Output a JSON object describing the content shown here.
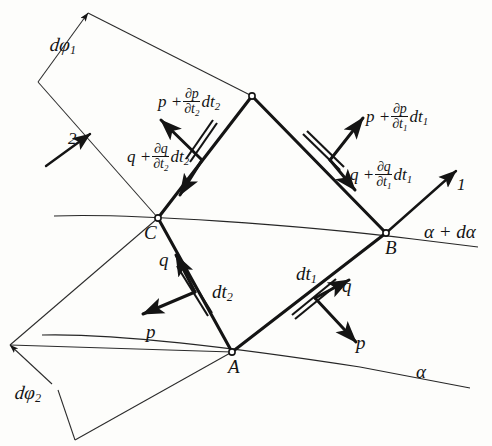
{
  "figure": {
    "background_color": "#fdfdfb",
    "ink_color": "#141414",
    "vertices": {
      "A": {
        "label": "A",
        "x": 232,
        "y": 352
      },
      "B": {
        "label": "B",
        "x": 386,
        "y": 233
      },
      "C": {
        "label": "C",
        "x": 158,
        "y": 218
      },
      "D": {
        "label": "",
        "x": 252,
        "y": 96
      }
    },
    "curve_labels": [
      {
        "name": "alpha-plus-dalpha",
        "text": "α + dα",
        "x": 424,
        "y": 222
      },
      {
        "name": "alpha",
        "text": "α",
        "x": 416,
        "y": 362
      }
    ],
    "axis_labels": [
      {
        "name": "direction-1",
        "text": "1",
        "x": 457,
        "y": 176
      },
      {
        "name": "direction-2",
        "text": "2",
        "x": 68,
        "y": 130
      }
    ],
    "angle_labels": [
      {
        "name": "d-phi-1",
        "text": "dφ",
        "sub": "1",
        "x": 50,
        "y": 35
      },
      {
        "name": "d-phi-2",
        "text": "dφ",
        "sub": "2",
        "x": 15,
        "y": 383
      }
    ],
    "force_labels": {
      "p_at_A_lower_left": {
        "text": "p",
        "x": 146,
        "y": 322
      },
      "q_at_A_lower_left": {
        "text": "q",
        "x": 159,
        "y": 274
      },
      "dt2_lower": {
        "text": "dt",
        "sub": "2",
        "x": 212,
        "y": 282
      },
      "p_at_A_lower_right": {
        "text": "p",
        "x": 356,
        "y": 333
      },
      "q_at_A_lower_right": {
        "text": "q",
        "x": 342,
        "y": 286
      },
      "dt1_lower": {
        "text": "dt",
        "sub": "1",
        "x": 300,
        "y": 268
      },
      "p_upper_left": {
        "lead": "p +",
        "num": "∂p",
        "den": "∂t",
        "den_sub": "2",
        "tail": "dt",
        "tail_sub": "2",
        "x": 158,
        "y": 90
      },
      "q_upper_left": {
        "lead": "q +",
        "num": "∂q",
        "den": "∂t",
        "den_sub": "2",
        "tail": "dt",
        "tail_sub": "2",
        "x": 131,
        "y": 145
      },
      "p_upper_right": {
        "lead": "p +",
        "num": "∂p",
        "den": "∂t",
        "den_sub": "1",
        "tail": "dt",
        "tail_sub": "1",
        "x": 368,
        "y": 105
      },
      "q_upper_right": {
        "lead": "q +",
        "num": "∂q",
        "den": "∂t",
        "den_sub": "1",
        "tail": "dt",
        "tail_sub": "1",
        "x": 352,
        "y": 163
      }
    }
  }
}
